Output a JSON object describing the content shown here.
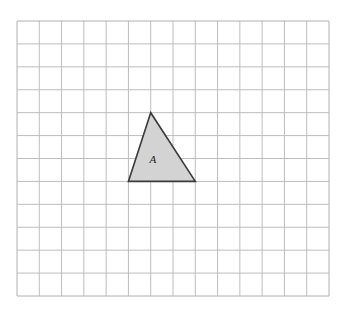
{
  "grid": {
    "left": 17,
    "top": 21,
    "right": 329,
    "bottom": 296,
    "cols": 14,
    "rows": 12,
    "line_color": "#bdbdbd",
    "border_color": "#b0b0b0"
  },
  "shapes": [
    {
      "label": "A",
      "type": "triangle",
      "vertices_grid": [
        [
          6,
          4
        ],
        [
          5,
          7
        ],
        [
          8,
          7
        ]
      ],
      "fill": "#d3d3d3",
      "stroke": "#3a3a3a",
      "label_pos_grid": [
        6.1,
        6.0
      ]
    }
  ]
}
